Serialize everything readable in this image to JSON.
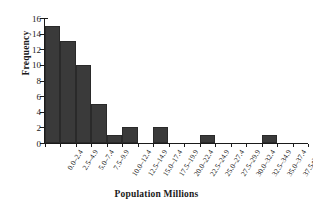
{
  "chart_data": {
    "type": "bar",
    "title": "",
    "xlabel": "Population Millions",
    "ylabel": "Frequency",
    "categories": [
      "0.0–2.4",
      "2.5–4.9",
      "5.0–7.4",
      "7.5–9.9",
      "10.0–12.4",
      "12.5–14.9",
      "15.0–17.4",
      "17.5–19.9",
      "20.0–22.4",
      "22.5–24.9",
      "25.0–27.4",
      "27.5–29.9",
      "30.0–32.4",
      "32.5–34.9",
      "35.0–37.4",
      "37.5–39.9",
      "More"
    ],
    "values": [
      15,
      13,
      10,
      5,
      1,
      2,
      0,
      2,
      0,
      0,
      1,
      0,
      0,
      0,
      1,
      0,
      0
    ],
    "ylim": [
      0,
      16
    ],
    "yticks": [
      0,
      2,
      4,
      6,
      8,
      10,
      12,
      14,
      16
    ],
    "ytick_labels": [
      "0",
      "2",
      "4",
      "6",
      "8",
      "10",
      "12",
      "14",
      "16"
    ],
    "grid": false,
    "legend": false,
    "bar_color": "#3a3a3a",
    "axis_color": "#1a1a1a",
    "background": "#ffffff"
  }
}
